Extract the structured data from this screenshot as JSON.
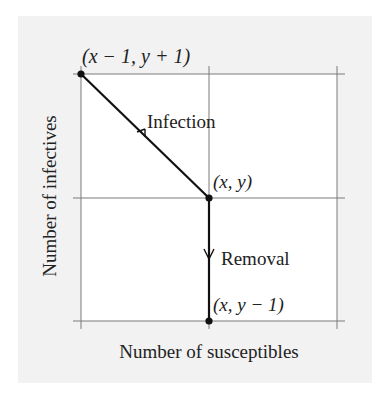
{
  "diagram": {
    "type": "state-transition",
    "axes": {
      "xlabel": "Number of susceptibles",
      "ylabel": "Number of infectives"
    },
    "points": [
      {
        "id": "top-left",
        "label": "(x − 1, y + 1)"
      },
      {
        "id": "center",
        "label": "(x, y)"
      },
      {
        "id": "bottom",
        "label": "(x, y − 1)"
      }
    ],
    "transitions": [
      {
        "from": "center",
        "to": "top-left",
        "label": "Infection"
      },
      {
        "from": "center",
        "to": "bottom",
        "label": "Removal"
      }
    ],
    "colors": {
      "panel": "#f2f2f2",
      "plot_area": "#ffffff",
      "grid": "#777777",
      "path": "#111111"
    }
  }
}
